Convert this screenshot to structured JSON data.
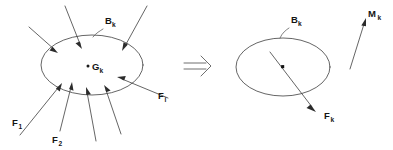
{
  "figure": {
    "background_color": "#ffffff",
    "line_color": "#3d3d3d",
    "text_color": "#141414",
    "implication_symbol": "⇒"
  },
  "left_diagram": {
    "body_label": {
      "base": "B",
      "sub": "k"
    },
    "centroid_label": {
      "base": "G",
      "sub": "k"
    },
    "centroid_marker": "dot",
    "force_labels": [
      {
        "base": "F",
        "sub": "1"
      },
      {
        "base": "F",
        "sub": "2"
      },
      {
        "base": "F",
        "sub": "i"
      }
    ],
    "force_arrow_count": 8,
    "arrow_direction": "inward"
  },
  "right_diagram": {
    "body_label": {
      "base": "B",
      "sub": "k"
    },
    "centroid_marker": "square",
    "resultant_force_label": {
      "base": "F",
      "sub": "k"
    },
    "moment_label": {
      "base": "M",
      "sub": "k"
    }
  }
}
